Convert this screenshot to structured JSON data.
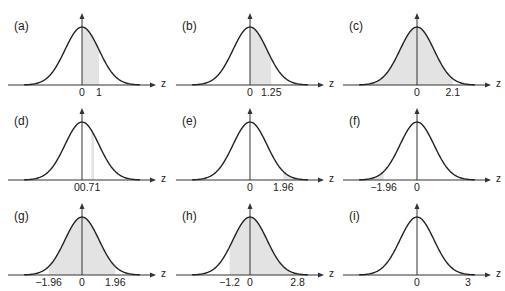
{
  "chart_data": [
    {
      "type": "area",
      "label": "(a)",
      "shade": [
        [
          0,
          1
        ]
      ],
      "ticks": [
        {
          "v": 0,
          "t": "0"
        },
        {
          "v": 1,
          "t": "1"
        }
      ],
      "xlabel": "z"
    },
    {
      "type": "area",
      "label": "(b)",
      "shade": [
        [
          0,
          1.25
        ]
      ],
      "ticks": [
        {
          "v": 0,
          "t": "0"
        },
        {
          "v": 1.25,
          "t": "1.25"
        }
      ],
      "xlabel": "z"
    },
    {
      "type": "area",
      "label": "(c)",
      "shade": [
        [
          -3.4,
          2.1
        ]
      ],
      "ticks": [
        {
          "v": 0,
          "t": "0"
        },
        {
          "v": 2.1,
          "t": "2.1"
        }
      ],
      "xlabel": "z"
    },
    {
      "type": "area",
      "label": "(d)",
      "shade": [
        [
          0.55,
          0.71
        ]
      ],
      "ticks": [
        {
          "v": 0.3,
          "t": "00.71"
        }
      ],
      "xlabel": "z"
    },
    {
      "type": "area",
      "label": "(e)",
      "shade": [
        [
          1.96,
          3.4
        ]
      ],
      "ticks": [
        {
          "v": 0,
          "t": "0"
        },
        {
          "v": 1.96,
          "t": "1.96"
        }
      ],
      "xlabel": "z"
    },
    {
      "type": "area",
      "label": "(f)",
      "shade": [
        [
          -3.4,
          -1.96
        ]
      ],
      "ticks": [
        {
          "v": -1.96,
          "t": "−1.96"
        },
        {
          "v": 0,
          "t": "0"
        }
      ],
      "xlabel": "z"
    },
    {
      "type": "area",
      "label": "(g)",
      "shade": [
        [
          -1.96,
          1.96
        ]
      ],
      "ticks": [
        {
          "v": -1.96,
          "t": "−1.96"
        },
        {
          "v": 0,
          "t": "0"
        },
        {
          "v": 1.96,
          "t": "1.96"
        }
      ],
      "xlabel": "z"
    },
    {
      "type": "area",
      "label": "(h)",
      "shade": [
        [
          -1.2,
          2.8
        ]
      ],
      "ticks": [
        {
          "v": -1.2,
          "t": "−1.2"
        },
        {
          "v": 0,
          "t": "0"
        },
        {
          "v": 2.8,
          "t": "2.8"
        }
      ],
      "xlabel": "z"
    },
    {
      "type": "area",
      "label": "(i)",
      "shade": [],
      "ticks": [
        {
          "v": 0,
          "t": "0"
        },
        {
          "v": 3,
          "t": "3"
        }
      ],
      "xlabel": "z"
    }
  ],
  "colors": {
    "curve": "#222222",
    "shade": "#e3e3e3",
    "axis": "#333333"
  }
}
